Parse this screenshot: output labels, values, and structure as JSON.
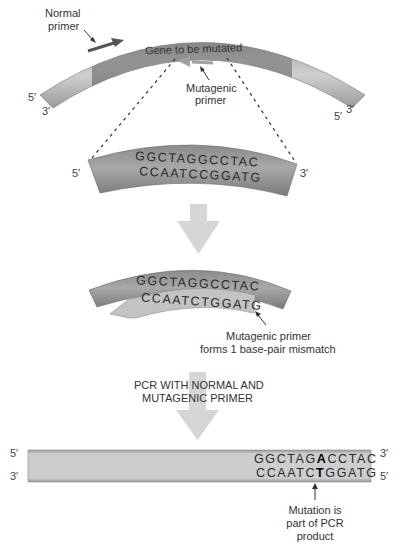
{
  "colors": {
    "dna_dark": "#6e6e6e",
    "dna_mid": "#9a9a9a",
    "dna_light": "#bdbdbd",
    "gene_region": "#7a7a7a",
    "normal_primer": "#5a5a5a",
    "mutagenic_primer": "#a8a8a8",
    "process_arrow": "#d6d6d6",
    "product_bar": "#c9c9c9",
    "text": "#333333"
  },
  "step1": {
    "normal_primer_label_line1": "Normal",
    "normal_primer_label_line2": "primer",
    "gene_label": "Gene to be mutated",
    "mutagenic_primer_label_line1": "Mutagenic",
    "mutagenic_primer_label_line2": "primer",
    "left_top_end": "5′",
    "left_bottom_end": "3′",
    "right_top_end": "3′",
    "right_bottom_end": "5′"
  },
  "step2": {
    "top_strand": "GGCTAGGCCTAC",
    "bottom_strand": "CCAATCCGGATG",
    "left_end": "5′",
    "right_end": "3′"
  },
  "step3": {
    "top_strand": "GGCTAGGCCTAC",
    "primer_strand": "CCAATCTGGATG",
    "note_line1": "Mutagenic primer",
    "note_line2": "forms 1 base-pair mismatch"
  },
  "step4": {
    "process_line1": "PCR WITH NORMAL AND",
    "process_line2": "MUTAGENIC PRIMER"
  },
  "product": {
    "top_strand_prefix": "GGCTAG",
    "top_strand_mut": "A",
    "top_strand_suffix": "CCTAC",
    "bottom_strand_prefix": "CCAATC",
    "bottom_strand_mut": "T",
    "bottom_strand_suffix": "GGATG",
    "left_top_end": "5′",
    "left_bottom_end": "3′",
    "right_top_end": "3′",
    "right_bottom_end": "5′",
    "note_line1": "Mutation is",
    "note_line2": "part of PCR",
    "note_line3": "product"
  }
}
